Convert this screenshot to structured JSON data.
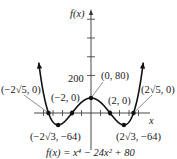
{
  "chart_data": {
    "type": "line",
    "title": "",
    "function_label": "f(x) = x⁴ − 24x² + 80",
    "xlabel": "x",
    "ylabel": "f(x)",
    "y_tick_label": "200",
    "y_tick_value": 200,
    "y_tick_step": 100,
    "x_tick_step": 1,
    "xlim": [
      -6,
      6
    ],
    "ylim": [
      -80,
      550
    ],
    "grid": false,
    "legend": "none",
    "series": [
      {
        "name": "f(x) = x^4 - 24x^2 + 80",
        "expression": "x^4 - 24x^2 + 80",
        "arrows_at_ends": true
      }
    ],
    "points": [
      {
        "label": "(−2√5, 0)",
        "x": -4.472,
        "y": 0
      },
      {
        "label": "(−2, 0)",
        "x": -2,
        "y": 0
      },
      {
        "label": "(0, 80)",
        "x": 0,
        "y": 80
      },
      {
        "label": "(2, 0)",
        "x": 2,
        "y": 0
      },
      {
        "label": "(2√5, 0)",
        "x": 4.472,
        "y": 0
      },
      {
        "label": "(−2√3, −64)",
        "x": -3.464,
        "y": -64
      },
      {
        "label": "(2√3, −64)",
        "x": 3.464,
        "y": -64
      }
    ]
  },
  "colors": {
    "curve": "#111111",
    "axes": "#333333",
    "text": "#222222"
  }
}
